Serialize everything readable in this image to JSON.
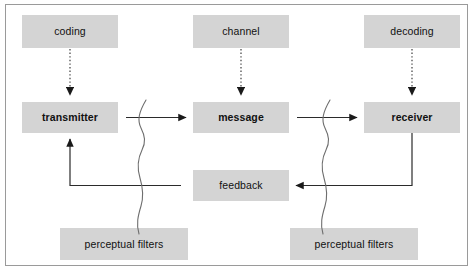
{
  "diagram": {
    "type": "flow-diagram",
    "frame": {
      "border_color": "#9a9a9a",
      "background": "#ffffff"
    },
    "node_style": {
      "fill": "#d4d4d4",
      "text_color": "#111111"
    },
    "nodes": [
      {
        "id": "coding",
        "label": "coding",
        "bold": false,
        "x": 22,
        "y": 15,
        "w": 96,
        "h": 33
      },
      {
        "id": "channel",
        "label": "channel",
        "bold": false,
        "x": 193,
        "y": 15,
        "w": 96,
        "h": 33
      },
      {
        "id": "decoding",
        "label": "decoding",
        "bold": false,
        "x": 364,
        "y": 15,
        "w": 96,
        "h": 33
      },
      {
        "id": "transmitter",
        "label": "transmitter",
        "bold": true,
        "x": 22,
        "y": 102,
        "w": 96,
        "h": 31
      },
      {
        "id": "message",
        "label": "message",
        "bold": true,
        "x": 193,
        "y": 102,
        "w": 96,
        "h": 31
      },
      {
        "id": "receiver",
        "label": "receiver",
        "bold": true,
        "x": 364,
        "y": 102,
        "w": 96,
        "h": 31
      },
      {
        "id": "feedback",
        "label": "feedback",
        "bold": false,
        "x": 193,
        "y": 170,
        "w": 96,
        "h": 31
      },
      {
        "id": "filters-left",
        "label": "perceptual filters",
        "bold": false,
        "x": 60,
        "y": 228,
        "w": 128,
        "h": 32
      },
      {
        "id": "filters-right",
        "label": "perceptual filters",
        "bold": false,
        "x": 290,
        "y": 228,
        "w": 128,
        "h": 32
      }
    ],
    "connectors": [
      {
        "id": "coding-to-transmitter",
        "style": "dotted",
        "from": "coding",
        "to": "transmitter"
      },
      {
        "id": "channel-to-message",
        "style": "dotted",
        "from": "channel",
        "to": "message"
      },
      {
        "id": "decoding-to-receiver",
        "style": "dotted",
        "from": "decoding",
        "to": "receiver"
      },
      {
        "id": "transmitter-to-message",
        "style": "solid",
        "from": "transmitter",
        "to": "message"
      },
      {
        "id": "message-to-receiver",
        "style": "solid",
        "from": "message",
        "to": "receiver"
      },
      {
        "id": "receiver-to-feedback",
        "style": "solid",
        "from": "receiver",
        "to": "feedback"
      },
      {
        "id": "feedback-to-transmitter",
        "style": "solid",
        "from": "feedback",
        "to": "transmitter"
      }
    ],
    "filter_waves": [
      {
        "id": "wave-left",
        "belongs_to": "filters-left",
        "crosses": [
          "transmitter-to-message",
          "feedback-to-transmitter"
        ]
      },
      {
        "id": "wave-right",
        "belongs_to": "filters-right",
        "crosses": [
          "message-to-receiver",
          "receiver-to-feedback"
        ]
      }
    ]
  }
}
